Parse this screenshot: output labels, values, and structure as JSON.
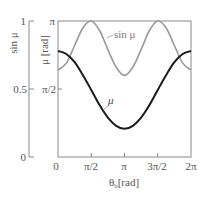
{
  "chart_data": {
    "type": "line",
    "title": "",
    "xlabel": "θb [rad]",
    "xlabel_main": "θ",
    "xlabel_sub": "b",
    "xlabel_unit": "[rad]",
    "ylabel_left": "sin μ",
    "ylabel_right": "μ [rad]",
    "x_ticks": [
      "0",
      "π/2",
      "π",
      "3π/2",
      "2π"
    ],
    "x_tick_values": [
      0,
      1.5708,
      3.1416,
      4.7124,
      6.2832
    ],
    "xlim": [
      0,
      6.2832
    ],
    "y_left_ticks": [
      "0",
      "0.5",
      "1"
    ],
    "y_left_tick_values": [
      0,
      0.5,
      1
    ],
    "y_left_lim": [
      0,
      1
    ],
    "y_right_ticks": [
      "0",
      "π/2",
      "π"
    ],
    "y_right_tick_values": [
      0,
      1.5708,
      3.1416
    ],
    "y_right_lim": [
      0,
      3.1416
    ],
    "grid": false,
    "legend": "inline annotations",
    "x": [
      0,
      0.3927,
      0.7854,
      1.1781,
      1.5708,
      1.9635,
      2.3562,
      2.7489,
      3.1416,
      3.5343,
      3.927,
      4.3197,
      4.7124,
      5.1051,
      5.4978,
      5.8905,
      6.2832
    ],
    "series": [
      {
        "name": "μ",
        "axis": "right",
        "color": "#1a1a1a",
        "values": [
          2.45,
          2.38,
          2.19,
          1.89,
          1.55,
          1.2,
          0.91,
          0.72,
          0.65,
          0.72,
          0.91,
          1.2,
          1.55,
          1.89,
          2.19,
          2.38,
          2.45
        ]
      },
      {
        "name": "sin μ",
        "axis": "left",
        "color": "#9a9a9a",
        "values": [
          0.64,
          0.69,
          0.82,
          0.95,
          1.0,
          0.93,
          0.79,
          0.66,
          0.6,
          0.66,
          0.79,
          0.93,
          1.0,
          0.95,
          0.82,
          0.69,
          0.64
        ]
      }
    ],
    "annotations": [
      {
        "text": "sin μ",
        "target": "sin μ"
      },
      {
        "text": "μ",
        "target": "μ"
      }
    ]
  }
}
